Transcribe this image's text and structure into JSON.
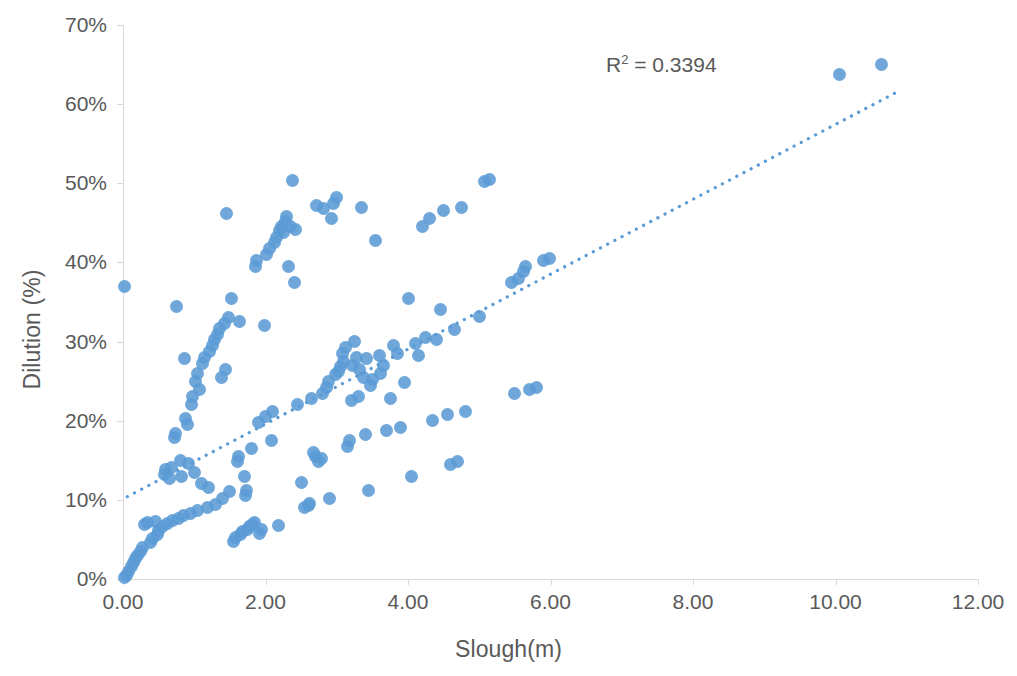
{
  "chart_data": {
    "type": "scatter",
    "title": "",
    "xlabel": "Slough(m)",
    "ylabel": "Dilution (%)",
    "xlim": [
      0,
      12
    ],
    "ylim": [
      0,
      0.7
    ],
    "xticks": [
      "0.00",
      "2.00",
      "4.00",
      "6.00",
      "8.00",
      "10.00",
      "12.00"
    ],
    "xtick_values": [
      0,
      2,
      4,
      6,
      8,
      10,
      12
    ],
    "yticks": [
      "0%",
      "10%",
      "20%",
      "30%",
      "40%",
      "50%",
      "60%",
      "70%"
    ],
    "ytick_values": [
      0,
      10,
      20,
      30,
      40,
      50,
      60,
      70
    ],
    "grid": false,
    "legend": false,
    "marker_color": "#5B9BD5",
    "trendline_color": "#5B9BD5",
    "trendline_style": "dotted",
    "annotation": "R² = 0.3394",
    "annotation_base": "R",
    "annotation_sup": "2",
    "annotation_rest": " = 0.3394",
    "r_squared": 0.3394,
    "trendline": {
      "x_start": 0.06,
      "y_start": 10.4,
      "x_end": 10.9,
      "y_end": 61.7,
      "slope": 4.73,
      "intercept": 10.2
    },
    "series": [
      {
        "name": "Dilution vs Slough",
        "points": [
          [
            0.02,
            0.2
          ],
          [
            0.05,
            0.5
          ],
          [
            0.02,
            37.0
          ],
          [
            0.08,
            1.0
          ],
          [
            0.12,
            1.6
          ],
          [
            0.15,
            2.1
          ],
          [
            0.18,
            2.6
          ],
          [
            0.2,
            3.0
          ],
          [
            0.24,
            3.5
          ],
          [
            0.28,
            4.0
          ],
          [
            0.3,
            6.9
          ],
          [
            0.35,
            7.1
          ],
          [
            0.38,
            4.6
          ],
          [
            0.42,
            5.1
          ],
          [
            0.45,
            7.3
          ],
          [
            0.48,
            5.6
          ],
          [
            0.5,
            6.1
          ],
          [
            0.55,
            6.6
          ],
          [
            0.58,
            13.2
          ],
          [
            0.6,
            13.8
          ],
          [
            0.62,
            7.0
          ],
          [
            0.65,
            12.7
          ],
          [
            0.68,
            14.1
          ],
          [
            0.7,
            7.4
          ],
          [
            0.72,
            17.9
          ],
          [
            0.74,
            18.4
          ],
          [
            0.75,
            34.4
          ],
          [
            0.78,
            7.7
          ],
          [
            0.8,
            15.0
          ],
          [
            0.82,
            13.0
          ],
          [
            0.85,
            8.0
          ],
          [
            0.86,
            27.9
          ],
          [
            0.88,
            20.3
          ],
          [
            0.9,
            19.5
          ],
          [
            0.92,
            14.6
          ],
          [
            0.95,
            8.3
          ],
          [
            0.96,
            22.1
          ],
          [
            0.98,
            23.0
          ],
          [
            1.0,
            13.5
          ],
          [
            1.02,
            25.0
          ],
          [
            1.04,
            26.0
          ],
          [
            1.05,
            8.6
          ],
          [
            1.08,
            24.0
          ],
          [
            1.1,
            12.1
          ],
          [
            1.12,
            27.2
          ],
          [
            1.15,
            28.0
          ],
          [
            1.18,
            9.0
          ],
          [
            1.2,
            11.5
          ],
          [
            1.22,
            28.8
          ],
          [
            1.25,
            29.5
          ],
          [
            1.28,
            30.2
          ],
          [
            1.3,
            9.4
          ],
          [
            1.32,
            30.9
          ],
          [
            1.35,
            31.6
          ],
          [
            1.38,
            25.5
          ],
          [
            1.4,
            10.2
          ],
          [
            1.42,
            32.3
          ],
          [
            1.44,
            26.5
          ],
          [
            1.45,
            46.2
          ],
          [
            1.48,
            33.0
          ],
          [
            1.5,
            11.0
          ],
          [
            1.52,
            35.5
          ],
          [
            1.55,
            4.8
          ],
          [
            1.58,
            5.2
          ],
          [
            1.6,
            14.8
          ],
          [
            1.62,
            15.5
          ],
          [
            1.64,
            32.5
          ],
          [
            1.65,
            5.6
          ],
          [
            1.68,
            6.0
          ],
          [
            1.7,
            13.0
          ],
          [
            1.72,
            10.5
          ],
          [
            1.74,
            11.2
          ],
          [
            1.75,
            6.3
          ],
          [
            1.78,
            6.6
          ],
          [
            1.8,
            16.5
          ],
          [
            1.82,
            6.9
          ],
          [
            1.85,
            7.2
          ],
          [
            1.86,
            39.5
          ],
          [
            1.88,
            40.3
          ],
          [
            1.9,
            19.8
          ],
          [
            1.92,
            5.8
          ],
          [
            1.95,
            6.2
          ],
          [
            1.98,
            32.0
          ],
          [
            2.0,
            20.5
          ],
          [
            2.02,
            41.0
          ],
          [
            2.05,
            41.8
          ],
          [
            2.08,
            17.5
          ],
          [
            2.1,
            21.2
          ],
          [
            2.12,
            42.5
          ],
          [
            2.15,
            43.2
          ],
          [
            2.18,
            6.8
          ],
          [
            2.2,
            44.0
          ],
          [
            2.22,
            44.6
          ],
          [
            2.25,
            43.8
          ],
          [
            2.28,
            45.2
          ],
          [
            2.3,
            45.8
          ],
          [
            2.32,
            39.5
          ],
          [
            2.35,
            44.5
          ],
          [
            2.38,
            50.4
          ],
          [
            2.4,
            37.5
          ],
          [
            2.42,
            44.2
          ],
          [
            2.45,
            22.0
          ],
          [
            2.5,
            12.2
          ],
          [
            2.55,
            9.0
          ],
          [
            2.6,
            9.3
          ],
          [
            2.62,
            9.6
          ],
          [
            2.65,
            22.8
          ],
          [
            2.68,
            16.0
          ],
          [
            2.7,
            15.5
          ],
          [
            2.72,
            47.2
          ],
          [
            2.75,
            14.8
          ],
          [
            2.78,
            15.2
          ],
          [
            2.8,
            23.5
          ],
          [
            2.82,
            46.8
          ],
          [
            2.85,
            24.2
          ],
          [
            2.88,
            25.0
          ],
          [
            2.9,
            10.2
          ],
          [
            2.92,
            45.5
          ],
          [
            2.95,
            47.5
          ],
          [
            2.98,
            25.8
          ],
          [
            3.0,
            48.2
          ],
          [
            3.02,
            26.2
          ],
          [
            3.05,
            26.8
          ],
          [
            3.08,
            28.5
          ],
          [
            3.1,
            27.5
          ],
          [
            3.12,
            29.2
          ],
          [
            3.15,
            16.8
          ],
          [
            3.18,
            17.5
          ],
          [
            3.2,
            22.5
          ],
          [
            3.22,
            27.0
          ],
          [
            3.25,
            30.0
          ],
          [
            3.28,
            28.0
          ],
          [
            3.3,
            23.0
          ],
          [
            3.32,
            26.5
          ],
          [
            3.35,
            46.9
          ],
          [
            3.38,
            25.5
          ],
          [
            3.4,
            18.2
          ],
          [
            3.42,
            27.8
          ],
          [
            3.45,
            11.2
          ],
          [
            3.48,
            24.5
          ],
          [
            3.5,
            25.2
          ],
          [
            3.55,
            42.8
          ],
          [
            3.6,
            28.2
          ],
          [
            3.62,
            26.0
          ],
          [
            3.65,
            27.0
          ],
          [
            3.7,
            18.8
          ],
          [
            3.75,
            22.8
          ],
          [
            3.8,
            29.5
          ],
          [
            3.85,
            28.5
          ],
          [
            3.9,
            19.2
          ],
          [
            3.95,
            24.8
          ],
          [
            4.0,
            35.5
          ],
          [
            4.05,
            13.0
          ],
          [
            4.1,
            29.8
          ],
          [
            4.15,
            28.2
          ],
          [
            4.2,
            44.5
          ],
          [
            4.25,
            30.5
          ],
          [
            4.3,
            45.5
          ],
          [
            4.35,
            20.0
          ],
          [
            4.4,
            30.2
          ],
          [
            4.45,
            34.0
          ],
          [
            4.5,
            46.5
          ],
          [
            4.55,
            20.8
          ],
          [
            4.6,
            14.5
          ],
          [
            4.65,
            31.5
          ],
          [
            4.7,
            14.8
          ],
          [
            4.75,
            47.0
          ],
          [
            4.8,
            21.2
          ],
          [
            5.0,
            33.2
          ],
          [
            5.08,
            50.2
          ],
          [
            5.15,
            50.5
          ],
          [
            5.45,
            37.5
          ],
          [
            5.5,
            23.5
          ],
          [
            5.55,
            38.0
          ],
          [
            5.62,
            38.8
          ],
          [
            5.65,
            39.5
          ],
          [
            5.7,
            24.0
          ],
          [
            5.8,
            24.2
          ],
          [
            5.9,
            40.2
          ],
          [
            5.98,
            40.5
          ],
          [
            10.05,
            63.7
          ],
          [
            10.65,
            65.0
          ]
        ]
      }
    ]
  }
}
